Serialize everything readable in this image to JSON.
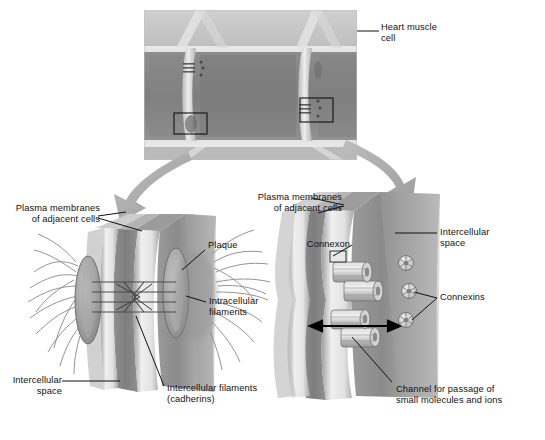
{
  "figure": {
    "kind": "biology-diagram",
    "background_color": "#ffffff",
    "ink_color": "#111111",
    "arrow_color": "#a8a8a8"
  },
  "top_panel": {
    "name": "cardiac-muscle-micrograph",
    "label": "Heart muscle\ncell",
    "callout_boxes": [
      {
        "name": "desmosome-callout",
        "x": 174,
        "y": 113,
        "w": 33,
        "h": 21
      },
      {
        "name": "gap-junction-callout",
        "x": 300,
        "y": 98,
        "w": 33,
        "h": 24
      }
    ]
  },
  "left_panel": {
    "name": "desmosome-detail",
    "title_label": "Plasma membranes\nof adjacent cells",
    "labels": {
      "plaque": "Plaque",
      "intracellular_filaments": "Intracellular\nfilaments",
      "intercellular_space": "Intercellular\nspace",
      "intercellular_filaments": "Intercellular filaments\n(cadherins)"
    }
  },
  "right_panel": {
    "name": "gap-junction-detail",
    "title_label": "Plasma membranes\nof adjacent cells",
    "labels": {
      "connexon": "Connexon",
      "intercellular_space": "Intercellular\nspace",
      "connexins": "Connexins",
      "channel": "Channel for passage of\nsmall molecules and ions"
    }
  }
}
